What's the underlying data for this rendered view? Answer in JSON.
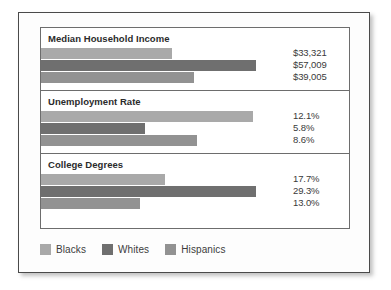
{
  "chart_data": {
    "type": "bar",
    "title": "",
    "orientation": "horizontal",
    "legend_position": "bottom",
    "grid": false,
    "categories": [
      "Median Household Income",
      "Unemployment Rate",
      "College Degrees"
    ],
    "series": [
      {
        "name": "Blacks",
        "color": "#a9a9a9",
        "values": [
          33321,
          12.1,
          17.7
        ],
        "labels": [
          "$33,321",
          "12.1%",
          "17.7%"
        ]
      },
      {
        "name": "Whites",
        "color": "#6f6f6f",
        "values": [
          57009,
          5.8,
          29.3
        ],
        "labels": [
          "$57,009",
          "5.8%",
          "29.3%"
        ]
      },
      {
        "name": "Hispanics",
        "color": "#929292",
        "values": [
          39005,
          8.6,
          13.0
        ],
        "labels": [
          "$39,005",
          "8.6%",
          "13.0%"
        ]
      }
    ],
    "panels": [
      {
        "title": "Median Household Income",
        "unit": "dollars",
        "bars": [
          {
            "series": "Blacks",
            "label": "$33,321",
            "value": 33321,
            "width_pct": 53.0
          },
          {
            "series": "Whites",
            "label": "$57,009",
            "value": 57009,
            "width_pct": 86.5
          },
          {
            "series": "Hispanics",
            "label": "$39,005",
            "value": 39005,
            "width_pct": 61.5
          }
        ]
      },
      {
        "title": "Unemployment Rate",
        "unit": "percent",
        "bars": [
          {
            "series": "Blacks",
            "label": "12.1%",
            "value": 12.1,
            "width_pct": 85.5
          },
          {
            "series": "Whites",
            "label": "5.8%",
            "value": 5.8,
            "width_pct": 42.0
          },
          {
            "series": "Hispanics",
            "label": "8.6%",
            "value": 8.6,
            "width_pct": 63.0
          }
        ]
      },
      {
        "title": "College Degrees",
        "unit": "percent",
        "bars": [
          {
            "series": "Blacks",
            "label": "17.7%",
            "value": 17.7,
            "width_pct": 50.0
          },
          {
            "series": "Whites",
            "label": "29.3%",
            "value": 29.3,
            "width_pct": 86.5
          },
          {
            "series": "Hispanics",
            "label": "13.0%",
            "value": 13.0,
            "width_pct": 40.0
          }
        ]
      }
    ],
    "legend": [
      {
        "label": "Blacks",
        "color": "#a9a9a9"
      },
      {
        "label": "Whites",
        "color": "#6f6f6f"
      },
      {
        "label": "Hispanics",
        "color": "#929292"
      }
    ]
  }
}
